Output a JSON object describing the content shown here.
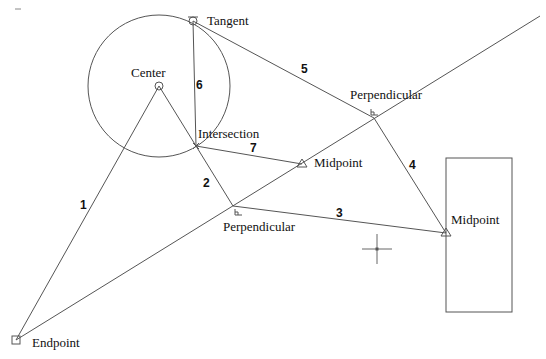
{
  "diagram": {
    "type": "cad-object-snap-illustration",
    "colors": {
      "background": "#ffffff",
      "line": "#555555",
      "text": "#111111"
    },
    "circle": {
      "cx": 159,
      "cy": 86,
      "r": 71
    },
    "rectangle": {
      "x": 446,
      "y": 158,
      "width": 66,
      "height": 154
    },
    "construction_line": {
      "x1": 16,
      "y1": 340,
      "x2": 540,
      "y2": 16
    },
    "crosshair": {
      "x": 377,
      "y": 249,
      "size": 15
    },
    "snap_points": [
      {
        "id": "tangent",
        "label": "Tangent",
        "x": 193,
        "y": 21,
        "marker": "tangent-circle",
        "label_x": 207,
        "label_y": 25
      },
      {
        "id": "center",
        "label": "Center",
        "x": 159,
        "y": 86,
        "marker": "center-circle",
        "label_x": 131,
        "label_y": 77
      },
      {
        "id": "intersection",
        "label": "Intersection",
        "x": 196,
        "y": 146,
        "marker": "intersection-x",
        "label_x": 198,
        "label_y": 138
      },
      {
        "id": "midpoint-line",
        "label": "Midpoint",
        "x": 302,
        "y": 164,
        "marker": "midpoint-triangle",
        "label_x": 314,
        "label_y": 167
      },
      {
        "id": "perpendicular-upper",
        "label": "Perpendicular",
        "x": 374,
        "y": 118,
        "marker": "perpendicular",
        "label_x": 350,
        "label_y": 99
      },
      {
        "id": "perpendicular-lower",
        "label": "Perpendicular",
        "x": 233,
        "y": 206,
        "marker": "perpendicular",
        "label_x": 223,
        "label_y": 231
      },
      {
        "id": "midpoint-rect",
        "label": "Midpoint",
        "x": 446,
        "y": 233,
        "marker": "midpoint-triangle",
        "label_x": 451,
        "label_y": 224
      },
      {
        "id": "endpoint",
        "label": "Endpoint",
        "x": 16,
        "y": 340,
        "marker": "endpoint-square",
        "label_x": 32,
        "label_y": 347
      }
    ],
    "segments": [
      {
        "number": "1",
        "from": "endpoint",
        "to": "center",
        "x1": 16,
        "y1": 340,
        "x2": 159,
        "y2": 86,
        "label_x": 80,
        "label_y": 209
      },
      {
        "number": "2",
        "from": "center",
        "to": "perpendicular-lower",
        "x1": 159,
        "y1": 86,
        "x2": 233,
        "y2": 206,
        "label_x": 203,
        "label_y": 187
      },
      {
        "number": "3",
        "from": "perpendicular-lower",
        "to": "midpoint-rect",
        "x1": 233,
        "y1": 206,
        "x2": 446,
        "y2": 233,
        "label_x": 336,
        "label_y": 217
      },
      {
        "number": "4",
        "from": "perpendicular-upper",
        "to": "midpoint-rect",
        "x1": 374,
        "y1": 118,
        "x2": 446,
        "y2": 233,
        "label_x": 409,
        "label_y": 169
      },
      {
        "number": "5",
        "from": "tangent",
        "to": "perpendicular-upper",
        "x1": 193,
        "y1": 21,
        "x2": 374,
        "y2": 118,
        "label_x": 301,
        "label_y": 73
      },
      {
        "number": "6",
        "from": "tangent",
        "to": "intersection",
        "x1": 193,
        "y1": 21,
        "x2": 196,
        "y2": 146,
        "label_x": 196,
        "label_y": 89
      },
      {
        "number": "7",
        "from": "intersection",
        "to": "midpoint-line",
        "x1": 196,
        "y1": 146,
        "x2": 302,
        "y2": 164,
        "label_x": 250,
        "label_y": 152
      }
    ]
  }
}
